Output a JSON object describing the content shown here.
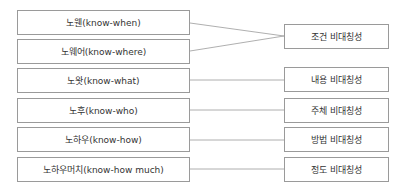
{
  "diagram": {
    "left_items": [
      {
        "label": "노웬(know-when)"
      },
      {
        "label": "노웨어(know-where)"
      },
      {
        "label": "노왓(know-what)"
      },
      {
        "label": "노후(know-who)"
      },
      {
        "label": "노하우(know-how)"
      },
      {
        "label": "노하우머치(know-how much)"
      }
    ],
    "right_items": [
      {
        "label": "조건 비대칭성"
      },
      {
        "label": "내용 비대칭성"
      },
      {
        "label": "주체 비대칭성"
      },
      {
        "label": "방법 비대칭성"
      },
      {
        "label": "정도 비대칭성"
      }
    ],
    "connections": [
      {
        "from": "노웬(know-when)",
        "to": "조건 비대칭성"
      },
      {
        "from": "노웨어(know-where)",
        "to": "조건 비대칭성"
      },
      {
        "from": "노왓(know-what)",
        "to": "내용 비대칭성"
      },
      {
        "from": "노후(know-who)",
        "to": "주체 비대칭성"
      },
      {
        "from": "노하우(know-how)",
        "to": "방법 비대칭성"
      },
      {
        "from": "노하우머치(know-how much)",
        "to": "정도 비대칭성"
      }
    ],
    "colors": {
      "border": "#9a9a9a",
      "line": "#9a9a9a",
      "text": "#333333"
    }
  }
}
